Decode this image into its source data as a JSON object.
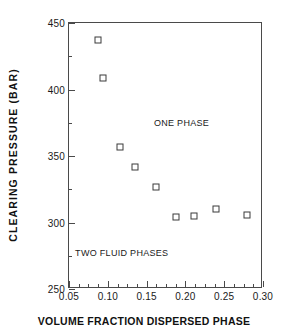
{
  "chart_data": {
    "type": "scatter",
    "title": "",
    "xlabel": "VOLUME FRACTION DISPERSED PHASE",
    "ylabel": "CLEARING PRESSURE (BAR)",
    "xlim": [
      0.05,
      0.3
    ],
    "ylim": [
      250,
      450
    ],
    "grid": false,
    "legend": "none",
    "xticks": [
      0.05,
      0.1,
      0.15,
      0.2,
      0.25,
      0.3
    ],
    "xtick_labels": [
      "0.05",
      "0.10",
      "0.15",
      "0.20",
      "0.25",
      "0.30"
    ],
    "yticks": [
      250,
      300,
      350,
      400,
      450
    ],
    "ytick_labels": [
      "250",
      "300",
      "350",
      "400",
      "450"
    ],
    "x_minor_interval": 0.0125,
    "y_minor_interval": 25,
    "marker": "open-square",
    "marker_color": "#3a3a3a",
    "x": [
      0.087,
      0.094,
      0.116,
      0.135,
      0.162,
      0.188,
      0.211,
      0.239,
      0.279
    ],
    "y": [
      437,
      409,
      357,
      342,
      327,
      304,
      305,
      310,
      306
    ],
    "annotations": [
      {
        "text": "ONE PHASE",
        "x": 0.195,
        "y": 375
      },
      {
        "text": "TWO FLUID PHASES",
        "x": 0.118,
        "y": 277
      }
    ]
  }
}
